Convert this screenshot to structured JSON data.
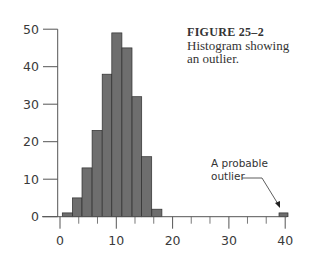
{
  "caption": {
    "figure_label": "FIGURE 25–2",
    "line1": "Histogram showing",
    "line2": "an outlier."
  },
  "annotation": {
    "line1": "A probable",
    "line2": "outlier"
  },
  "colors": {
    "bar_fill": "#6e6e6e",
    "bar_stroke": "#2e2e2e",
    "axis": "#555555",
    "text": "#3a3a3a"
  },
  "chart_data": {
    "type": "bar",
    "title": "FIGURE 25–2 Histogram showing an outlier.",
    "xlabel": "",
    "ylabel": "",
    "xlim": [
      0,
      40
    ],
    "ylim": [
      0,
      50
    ],
    "x_ticks": [
      0,
      10,
      20,
      30,
      40
    ],
    "x_tick_labels": [
      "0",
      "10",
      "20",
      "30",
      "40"
    ],
    "x_minor_tick_interval": 3.33,
    "y_ticks": [
      0,
      10,
      20,
      30,
      40,
      50
    ],
    "y_tick_labels": [
      "0",
      "10",
      "20",
      "30",
      "40",
      "50"
    ],
    "grid": false,
    "bin_width": 1.77,
    "bins": [
      {
        "start": 0.4,
        "end": 2.2,
        "count": 1
      },
      {
        "start": 2.2,
        "end": 3.9,
        "count": 5
      },
      {
        "start": 3.9,
        "end": 5.7,
        "count": 13
      },
      {
        "start": 5.7,
        "end": 7.5,
        "count": 23
      },
      {
        "start": 7.5,
        "end": 9.2,
        "count": 38
      },
      {
        "start": 9.2,
        "end": 11.0,
        "count": 49
      },
      {
        "start": 11.0,
        "end": 12.8,
        "count": 45
      },
      {
        "start": 12.8,
        "end": 14.5,
        "count": 32
      },
      {
        "start": 14.5,
        "end": 16.3,
        "count": 16
      },
      {
        "start": 16.3,
        "end": 18.1,
        "count": 2
      },
      {
        "start": 38.9,
        "end": 40.5,
        "count": 1
      }
    ],
    "categories": [
      "0.4–2.2",
      "2.2–3.9",
      "3.9–5.7",
      "5.7–7.5",
      "7.5–9.2",
      "9.2–11.0",
      "11.0–12.8",
      "12.8–14.5",
      "14.5–16.3",
      "16.3–18.1",
      "38.9–40.5"
    ],
    "values": [
      1,
      5,
      13,
      23,
      38,
      49,
      45,
      32,
      16,
      2,
      1
    ],
    "annotations": [
      {
        "text": "A probable outlier",
        "points_to_x": 39.7,
        "points_to_y": 1
      }
    ]
  }
}
